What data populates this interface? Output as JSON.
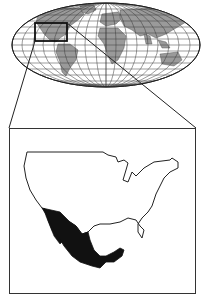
{
  "figure": {
    "type": "locator-map",
    "projection": "world-elliptical",
    "highlighted_region": "Mexico",
    "context_region": "United States (contiguous)",
    "colors": {
      "background": "#ffffff",
      "land_world": "#9a9a9a",
      "graticule": "#3a3a3a",
      "outline": "#222222",
      "highlight_fill": "#111111",
      "inset_land_fill": "#ffffff"
    }
  }
}
